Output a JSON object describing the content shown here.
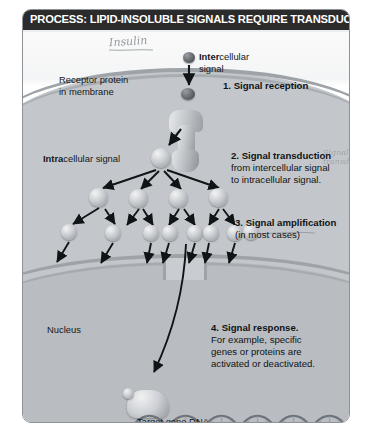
{
  "figure": {
    "title": "PROCESS: LIPID-INSOLUBLE SIGNALS REQUIRE TRANSDUCTION",
    "type": "biology-process-diagram",
    "background_color": "#eceff1",
    "title_bar_color": "#2b2b2b",
    "frame_border_color": "#8e9296"
  },
  "annotations": {
    "handwritten_top": "Insulin",
    "handwritten_right": "Signal transduction"
  },
  "labels": {
    "intercellular_bold": "Inter",
    "intercellular_rest": "cellular",
    "intercellular_line2": "signal",
    "receptor_line1": "Receptor protein",
    "receptor_line2": "in membrane",
    "intracellular_bold": "Intra",
    "intracellular_rest": "cellular signal",
    "nucleus": "Nucleus",
    "target_gene": "Target gene DNA"
  },
  "steps": [
    {
      "number": "1.",
      "heading": "1. Signal reception",
      "body": ""
    },
    {
      "number": "2.",
      "heading": "2. Signal transduction",
      "body_line1": "from intercellular signal",
      "body_line2": "to intracellular signal."
    },
    {
      "number": "3.",
      "heading": "3. Signal amplification",
      "body_line1": "(in most cases)"
    },
    {
      "number": "4.",
      "heading": "4. Signal response.",
      "body_line1": "For example, specific",
      "body_line2": "genes or proteins are",
      "body_line3": "activated or deactivated."
    }
  ],
  "cascade": {
    "tier1_count": 1,
    "tier2_count": 4,
    "tier3_count": 8,
    "description": "Signal amplification cascade from one intracellular signal molecule"
  },
  "colors": {
    "cytoplasm": "#c3c7cb",
    "nucleoplasm": "#b9bdc2",
    "membrane": "#9ea3a8",
    "signal_molecule_dark": "#3c4044",
    "signal_molecule_light": "#c9ccd0"
  }
}
